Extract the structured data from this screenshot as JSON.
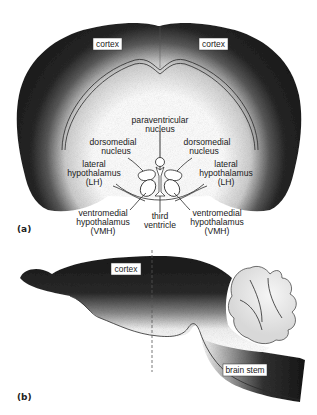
{
  "figure": {
    "panel_a": {
      "label": "(a)",
      "view": "coronal section",
      "region_labels": {
        "cortex_left": "cortex",
        "cortex_right": "cortex",
        "paraventricular_1": "paraventricular",
        "paraventricular_2": "nucleus",
        "dorsomedial_left_1": "dorsomedial",
        "dorsomedial_left_2": "nucleus",
        "dorsomedial_right_1": "dorsomedial",
        "dorsomedial_right_2": "nucleus",
        "lateral_left_1": "lateral",
        "lateral_left_2": "hypothalamus",
        "lateral_left_3": "(LH)",
        "lateral_right_1": "lateral",
        "lateral_right_2": "hypothalamus",
        "lateral_right_3": "(LH)",
        "ventromedial_left_1": "ventromedial",
        "ventromedial_left_2": "hypothalamus",
        "ventromedial_left_3": "(VMH)",
        "third_ventricle_1": "third",
        "third_ventricle_2": "ventricle",
        "ventromedial_right_1": "ventromedial",
        "ventromedial_right_2": "hypothalamus",
        "ventromedial_right_3": "(VMH)"
      }
    },
    "panel_b": {
      "label": "(b)",
      "view": "sagittal section",
      "region_labels": {
        "cortex": "cortex",
        "brain_stem": "brain stem"
      }
    },
    "colors": {
      "tissue_dark": "#1c1c1c",
      "tissue_light": "#ffffff",
      "ink": "#222222"
    }
  }
}
